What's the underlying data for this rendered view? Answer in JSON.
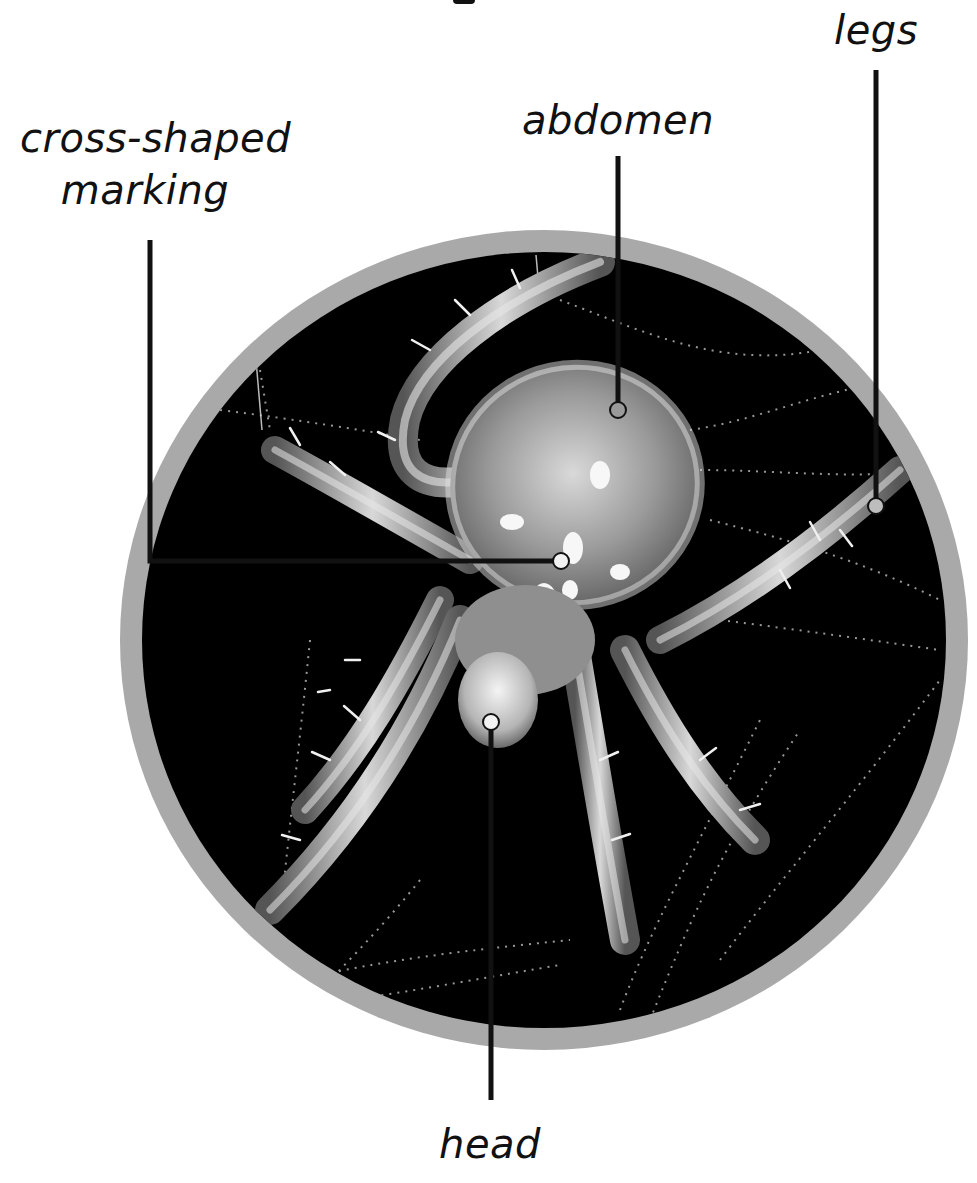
{
  "figure": {
    "heading_fragment_visible": true
  },
  "labels": {
    "cross_marking": {
      "line1": "cross-shaped",
      "line2": "marking"
    },
    "abdomen": "abdomen",
    "legs": "legs",
    "head": "head"
  },
  "pointers": [
    {
      "name": "cross-shaped marking",
      "path": [
        [
          150,
          240
        ],
        [
          150,
          561
        ],
        [
          561,
          561
        ]
      ],
      "endpoint": [
        561,
        561
      ]
    },
    {
      "name": "abdomen",
      "path": [
        [
          618,
          156
        ],
        [
          618,
          410
        ]
      ],
      "endpoint": [
        618,
        410
      ]
    },
    {
      "name": "legs",
      "path": [
        [
          876,
          70
        ],
        [
          876,
          506
        ]
      ],
      "endpoint": [
        876,
        506
      ]
    },
    {
      "name": "head",
      "path": [
        [
          491,
          1100
        ],
        [
          491,
          722
        ]
      ],
      "endpoint": [
        491,
        722
      ]
    }
  ],
  "colors": {
    "ring": "#a9a9a9",
    "photo_background": "#000000",
    "pointer_line": "#111111",
    "pointer_endpoint_fill": "#f2f2f2",
    "label_text": "#111111"
  }
}
